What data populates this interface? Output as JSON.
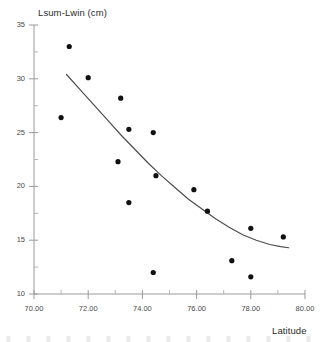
{
  "chart_data": {
    "type": "scatter",
    "title": "",
    "ylabel": "Lsum-Lwin (cm)",
    "xlabel": "Latitude",
    "xlim": [
      70.0,
      80.0
    ],
    "ylim": [
      10,
      35
    ],
    "grid": false,
    "legend": "none",
    "x_tick_labels": [
      "70.00",
      "72.00",
      "74.00",
      "76.00",
      "78.00",
      "80.00"
    ],
    "x_ticks": [
      70,
      72,
      74,
      76,
      78,
      80
    ],
    "y_tick_labels": [
      "35",
      "30",
      "25",
      "20",
      "15",
      "10"
    ],
    "y_ticks": [
      35,
      30,
      25,
      20,
      15,
      10
    ],
    "y_minor_ticks": [
      32.5,
      27.5,
      22.5,
      17.5,
      12.5
    ],
    "x_minor_ticks": [
      71,
      73,
      75,
      77,
      79
    ],
    "marker": {
      "shape": "circle",
      "color": "#111111",
      "size": 4.0
    },
    "points": [
      {
        "x": 71.3,
        "y": 33.0
      },
      {
        "x": 72.0,
        "y": 30.1
      },
      {
        "x": 71.0,
        "y": 26.4
      },
      {
        "x": 73.2,
        "y": 28.2
      },
      {
        "x": 73.5,
        "y": 25.3
      },
      {
        "x": 74.4,
        "y": 25.0
      },
      {
        "x": 73.1,
        "y": 22.3
      },
      {
        "x": 74.5,
        "y": 21.0
      },
      {
        "x": 73.5,
        "y": 18.5
      },
      {
        "x": 75.9,
        "y": 19.7
      },
      {
        "x": 76.4,
        "y": 17.7
      },
      {
        "x": 78.0,
        "y": 16.1
      },
      {
        "x": 79.2,
        "y": 15.3
      },
      {
        "x": 77.3,
        "y": 13.1
      },
      {
        "x": 74.4,
        "y": 12.0
      },
      {
        "x": 78.0,
        "y": 11.6
      }
    ],
    "fit_curve": {
      "name": "fitted trend line",
      "color": "#4d4d4d",
      "width": 1.2,
      "x_range": [
        71.2,
        79.4
      ],
      "points": [
        {
          "x": 71.2,
          "y": 30.4
        },
        {
          "x": 71.7,
          "y": 29.0
        },
        {
          "x": 72.2,
          "y": 27.6
        },
        {
          "x": 72.7,
          "y": 26.2
        },
        {
          "x": 73.2,
          "y": 24.8
        },
        {
          "x": 73.7,
          "y": 23.5
        },
        {
          "x": 74.2,
          "y": 22.2
        },
        {
          "x": 74.7,
          "y": 21.0
        },
        {
          "x": 75.2,
          "y": 19.9
        },
        {
          "x": 75.7,
          "y": 18.8
        },
        {
          "x": 76.2,
          "y": 17.9
        },
        {
          "x": 76.7,
          "y": 17.0
        },
        {
          "x": 77.2,
          "y": 16.2
        },
        {
          "x": 77.7,
          "y": 15.5
        },
        {
          "x": 78.2,
          "y": 15.0
        },
        {
          "x": 78.7,
          "y": 14.6
        },
        {
          "x": 79.1,
          "y": 14.4
        },
        {
          "x": 79.4,
          "y": 14.3
        }
      ]
    }
  }
}
